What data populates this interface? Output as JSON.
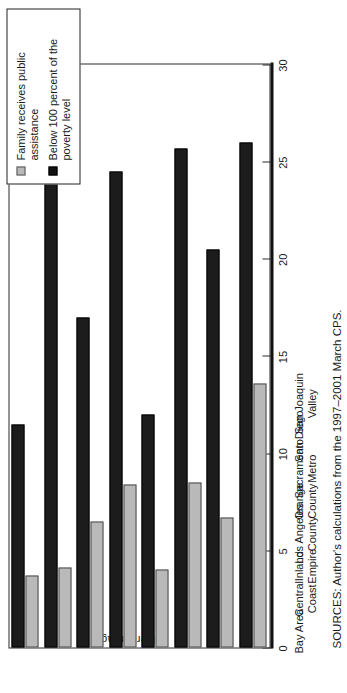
{
  "chart_data": {
    "type": "bar",
    "orientation": "horizontal",
    "title": "",
    "xlabel": "Percentage",
    "ylabel": "",
    "xlim": [
      0,
      30
    ],
    "ticks": [
      0,
      5,
      10,
      15,
      20,
      25,
      30
    ],
    "tick_labels": [
      "0",
      "5",
      "10",
      "15",
      "20",
      "25",
      "30"
    ],
    "grid": false,
    "legend_position": "top-right",
    "categories": [
      "Bay Area",
      "Central Coast",
      "Inland Empire",
      "Los Angeles County",
      "Orange County",
      "Sacramento Metro",
      "San Diego",
      "San Joaquin Valley"
    ],
    "category_lines": [
      [
        "Bay Area",
        ""
      ],
      [
        "Central",
        "Coast"
      ],
      [
        "Inland",
        "Empire"
      ],
      [
        "Los Angeles",
        "County"
      ],
      [
        "Orange",
        "County"
      ],
      [
        "Sacramento",
        "Metro"
      ],
      [
        "San Diego",
        ""
      ],
      [
        "San Joaquin",
        "Valley"
      ]
    ],
    "series": [
      {
        "name": "Family receives public assistance",
        "color": "#b9b9b9",
        "values": [
          3.7,
          4.1,
          6.5,
          8.4,
          4.0,
          8.5,
          6.7,
          13.6
        ]
      },
      {
        "name": "Below 100 percent of the poverty level",
        "color": "#1c1c1c",
        "values": [
          11.5,
          26.5,
          17.0,
          24.5,
          12.0,
          25.7,
          20.5,
          26.0
        ]
      }
    ]
  },
  "legend": {
    "items": [
      {
        "swatch": "light",
        "label": "Family receives public assistance"
      },
      {
        "swatch": "dark",
        "label": "Below 100 percent of the poverty level"
      }
    ]
  },
  "axis": {
    "y_title": "Percentage"
  },
  "notes": {
    "source": "SOURCES: Author's calculations from the 1997–2001 March CPS."
  }
}
